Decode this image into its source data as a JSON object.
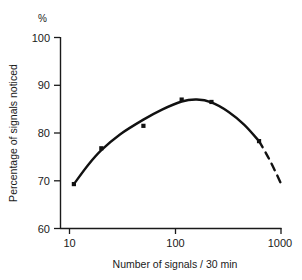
{
  "chart_data": {
    "type": "line",
    "title": "",
    "subtitle": "",
    "xlabel": "Number of signals / 30 min",
    "ylabel": "Percentage of signals noticed",
    "yunit": "%",
    "xscale": "log",
    "yscale": "linear",
    "xlim": [
      10,
      1000
    ],
    "ylim": [
      60,
      100
    ],
    "grid": false,
    "legend": null,
    "xticks": [
      10,
      100,
      1000
    ],
    "xtick_labels": [
      "10",
      "100",
      "1000"
    ],
    "yticks": [
      60,
      70,
      80,
      90,
      100
    ],
    "ytick_labels": [
      "60",
      "70",
      "80",
      "90",
      "100"
    ],
    "series": [
      {
        "name": "observed-points",
        "style": "scatter",
        "marker": "square",
        "color": "#111111",
        "x": [
          11,
          20,
          50,
          115,
          220,
          620
        ],
        "y": [
          69.3,
          76.8,
          81.5,
          87.0,
          86.5,
          78.3
        ]
      },
      {
        "name": "fitted-curve-solid",
        "style": "line-solid",
        "color": "#111111",
        "x": [
          11,
          15,
          20,
          30,
          50,
          75,
          115,
          160,
          220,
          320,
          450,
          620
        ],
        "y": [
          69.3,
          73.3,
          76.4,
          79.7,
          82.8,
          84.9,
          86.6,
          87.0,
          86.4,
          84.4,
          81.7,
          78.3
        ]
      },
      {
        "name": "extrapolated-curve-dashed",
        "style": "line-dashed",
        "color": "#111111",
        "x": [
          620,
          720,
          830,
          1000
        ],
        "y": [
          78.3,
          75.8,
          73.2,
          69.4
        ]
      }
    ],
    "annotations": []
  }
}
